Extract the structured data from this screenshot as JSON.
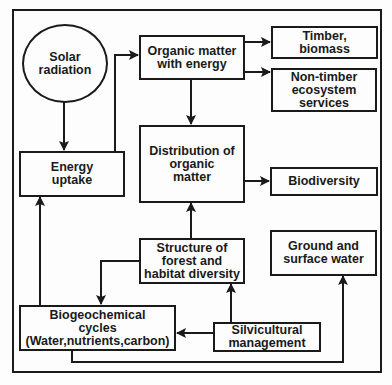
{
  "diagram": {
    "nodes": {
      "solar": {
        "label": "Solar\nradiation",
        "shape": "circle"
      },
      "energy_uptake": {
        "label": "Energy\nuptake"
      },
      "organic_matter": {
        "label": "Organic matter\nwith energy"
      },
      "timber": {
        "label": "Timber,\nbiomass"
      },
      "non_timber": {
        "label": "Non-timber\necosystem\nservices"
      },
      "distribution": {
        "label": "Distribution of\norganic\nmatter"
      },
      "biodiversity": {
        "label": "Biodiversity"
      },
      "structure": {
        "label": "Structure of\nforest and\nhabitat diversity"
      },
      "ground_water": {
        "label": "Ground and\nsurface water"
      },
      "biogeochemical": {
        "label": "Biogeochemical\ncycles\n(Water,nutrients,carbon)"
      },
      "silvicultural": {
        "label": "Silvicultural\nmanagement"
      }
    },
    "edges": [
      {
        "from": "Solar radiation",
        "to": "Energy uptake"
      },
      {
        "from": "Energy uptake",
        "to": "Organic matter with energy"
      },
      {
        "from": "Organic matter with energy",
        "to": "Timber, biomass"
      },
      {
        "from": "Organic matter with energy",
        "to": "Non-timber ecosystem services"
      },
      {
        "from": "Organic matter with energy",
        "to": "Distribution of organic matter"
      },
      {
        "from": "Distribution of organic matter",
        "to": "Biodiversity"
      },
      {
        "from": "Structure of forest and habitat diversity",
        "to": "Distribution of organic matter"
      },
      {
        "from": "Structure of forest and habitat diversity",
        "to": "Biogeochemical cycles"
      },
      {
        "from": "Biogeochemical cycles",
        "to": "Energy uptake"
      },
      {
        "from": "Silvicultural management",
        "to": "Biogeochemical cycles"
      },
      {
        "from": "Silvicultural management",
        "to": "Structure of forest and habitat diversity"
      },
      {
        "from": "Biogeochemical cycles",
        "to": "Ground and surface water"
      }
    ],
    "colors": {
      "line": "#1a1a1a",
      "background": "#fdfdfd"
    }
  }
}
